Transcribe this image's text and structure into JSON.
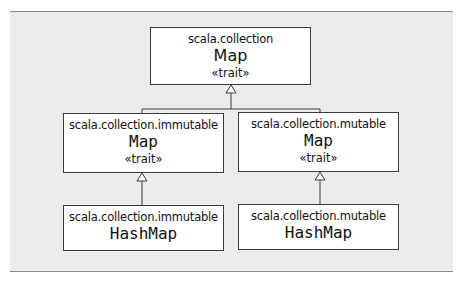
{
  "diagram": {
    "type": "uml-class-hierarchy",
    "nodes": [
      {
        "id": "root",
        "package": "scala.collection",
        "name": "Map",
        "stereotype": "«trait»"
      },
      {
        "id": "imm_map",
        "package": "scala.collection.immutable",
        "name": "Map",
        "stereotype": "«trait»"
      },
      {
        "id": "mut_map",
        "package": "scala.collection.mutable",
        "name": "Map",
        "stereotype": "«trait»"
      },
      {
        "id": "imm_hashmap",
        "package": "scala.collection.immutable",
        "name": "HashMap"
      },
      {
        "id": "mut_hashmap",
        "package": "scala.collection.mutable",
        "name": "HashMap"
      }
    ],
    "edges": [
      {
        "from": "imm_map",
        "to": "root",
        "kind": "inheritance"
      },
      {
        "from": "mut_map",
        "to": "root",
        "kind": "inheritance"
      },
      {
        "from": "imm_hashmap",
        "to": "imm_map",
        "kind": "inheritance"
      },
      {
        "from": "mut_hashmap",
        "to": "mut_map",
        "kind": "inheritance"
      }
    ],
    "colors": {
      "panel": "#ececec",
      "box": "#ffffff",
      "line": "#3a3a3a"
    }
  }
}
